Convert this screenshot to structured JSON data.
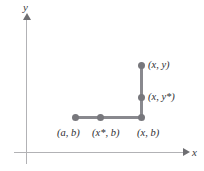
{
  "figure": {
    "background_color": "#ffffff",
    "line_color": "#89898e",
    "point_color": "#77777c",
    "axis_color": "#b2b2b5",
    "text_color": "#2e2e32"
  },
  "axes": {
    "y_label": "y",
    "x_label": "x",
    "y_arrow_icon": "arrow-up-icon",
    "x_arrow_icon": "arrow-right-icon"
  },
  "points": [
    {
      "id": "ab",
      "label": "(a, b)",
      "x": 75,
      "y": 117
    },
    {
      "id": "xstarb",
      "label": "(x*, b)",
      "x": 100,
      "y": 117
    },
    {
      "id": "xb",
      "label": "(x, b)",
      "x": 141,
      "y": 117
    },
    {
      "id": "xystar",
      "label": "(x, y*)",
      "x": 141,
      "y": 97
    },
    {
      "id": "xy",
      "label": "(x, y)",
      "x": 141,
      "y": 65
    }
  ],
  "segments": [
    {
      "id": "horizontal",
      "from": "ab",
      "to": "xb"
    },
    {
      "id": "vertical",
      "from": "xb",
      "to": "xy"
    }
  ],
  "chart_data": {
    "type": "scatter",
    "title": "",
    "xlabel": "x",
    "ylabel": "y",
    "grid": false,
    "legend": "none",
    "points": [
      {
        "label": "(a, b)",
        "x": 75,
        "y": 117
      },
      {
        "label": "(x*, b)",
        "x": 100,
        "y": 117
      },
      {
        "label": "(x, b)",
        "x": 141,
        "y": 117
      },
      {
        "label": "(x, y*)",
        "x": 141,
        "y": 97
      },
      {
        "label": "(x, y)",
        "x": 141,
        "y": 65
      }
    ],
    "annotations": [
      "(a, b)",
      "(x*, b)",
      "(x, b)",
      "(x, y*)",
      "(x, y)"
    ]
  }
}
